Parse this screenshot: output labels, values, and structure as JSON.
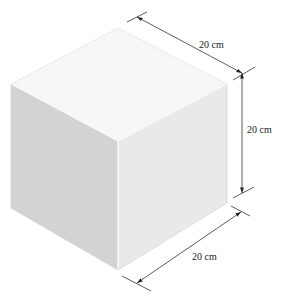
{
  "figure": {
    "type": "isometric-cube",
    "colors": {
      "top_face": "#f6f6f6",
      "left_face": "#d3d3d3",
      "right_face": "#e9e9e9",
      "edge_highlight": "#ffffff",
      "outline": "#c8c8c8",
      "dimension_line": "#333333",
      "background": "#ffffff"
    },
    "dimensions": [
      {
        "id": "top-edge",
        "label": "20 cm"
      },
      {
        "id": "right-height",
        "label": "20 cm"
      },
      {
        "id": "bottom-edge",
        "label": "20 cm"
      }
    ]
  }
}
